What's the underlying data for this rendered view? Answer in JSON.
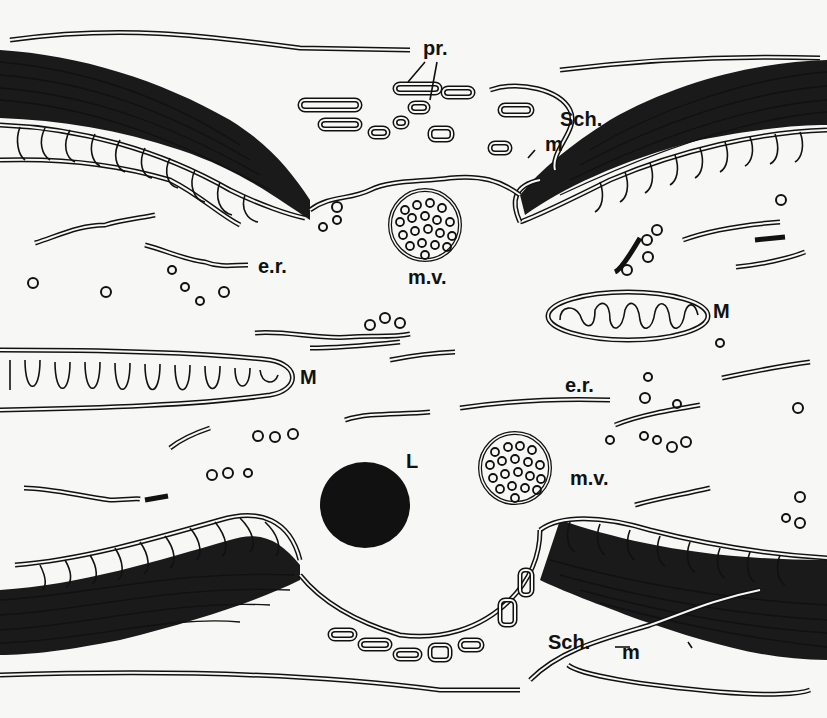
{
  "figure": {
    "background": "#f7f7f5",
    "ink": "#111111",
    "labels": {
      "pr": "pr.",
      "sch_top": "Sch.",
      "m_top": "m",
      "er_left": "e.r.",
      "mv_top": "m.v.",
      "M_right": "M",
      "M_left": "M",
      "er_center": "e.r.",
      "L": "L",
      "mv_bottom": "m.v.",
      "sch_bottom": "Sch.",
      "m_bottom": "m"
    }
  }
}
